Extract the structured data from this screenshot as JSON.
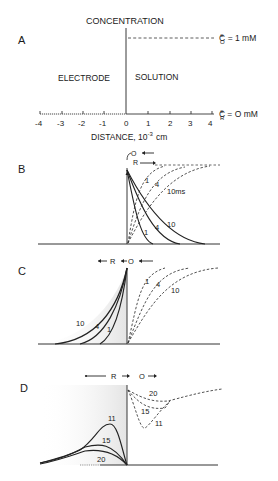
{
  "panel_a": {
    "letter": "A",
    "title": "CONCENTRATION",
    "left_region": "ELECTRODE",
    "right_region": "SOLUTION",
    "co_label": "C",
    "co_sup": "o",
    "co_sub": "O",
    "co_value": "= 1 mM",
    "cr_label": "C",
    "cr_sup": "o",
    "cr_sub": "R",
    "cr_value": "= O mM",
    "ticks": [
      "-4",
      "-3",
      "-2",
      "-1",
      "0",
      "1",
      "2",
      "3",
      "4"
    ],
    "axis_label": "DISTANCE, 10",
    "axis_exp": "-3",
    "axis_unit": "cm"
  },
  "panel_b": {
    "letter": "B",
    "o_label": "O",
    "r_label": "R",
    "dashed_labels": [
      "1",
      "4",
      "10ms"
    ],
    "solid_labels": [
      "1",
      "4",
      "10"
    ]
  },
  "panel_c": {
    "letter": "C",
    "r_label": "R",
    "o_label": "O",
    "solid_labels": [
      "10",
      "4",
      "1"
    ],
    "dashed_labels": [
      "1",
      "4",
      "10"
    ]
  },
  "panel_d": {
    "letter": "D",
    "r_label": "R",
    "o_label": "O",
    "solid_labels": [
      "11",
      "15",
      "20"
    ],
    "dashed_labels": [
      "20",
      "15",
      "11"
    ]
  }
}
